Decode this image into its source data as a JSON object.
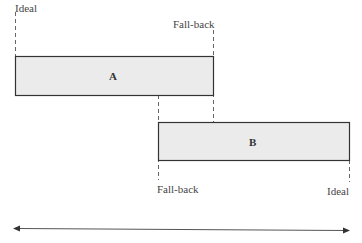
{
  "diagram": {
    "boxes": [
      {
        "id": "A",
        "label": "A",
        "left_marker": "Ideal",
        "right_marker": "Fall-back"
      },
      {
        "id": "B",
        "label": "B",
        "left_marker": "Fall-back",
        "right_marker": "Ideal"
      }
    ],
    "labels": {
      "a_ideal": "Ideal",
      "a_fallback": "Fall-back",
      "b_fallback": "Fall-back",
      "b_ideal": "Ideal"
    },
    "colors": {
      "box_fill": "#ebebeb",
      "box_stroke": "#333333",
      "dash": "#555555",
      "arrow": "#333333"
    },
    "axis": {
      "type": "double-headed-arrow"
    }
  }
}
